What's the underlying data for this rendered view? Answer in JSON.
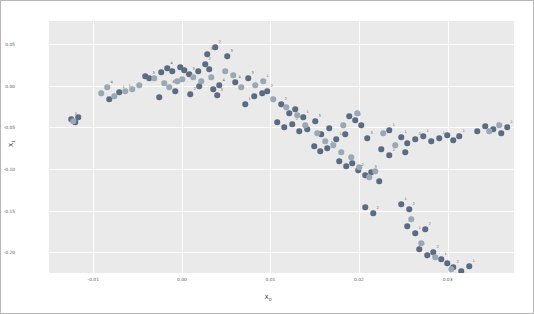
{
  "figure": {
    "background": "#ffffff",
    "border_color": "#b8b8b8",
    "plot_background": "#eaeaea",
    "grid_color": "#ffffff"
  },
  "axis": {
    "xlabel_main": "X",
    "xlabel_sub": "0",
    "ylabel_main": "X",
    "ylabel_sub": "1"
  },
  "chart_data": {
    "type": "scatter",
    "title": "",
    "xlabel": "X_0",
    "ylabel": "X_1",
    "xlim": [
      -0.015,
      0.0375
    ],
    "ylim": [
      -0.225,
      0.0775
    ],
    "xticks": [
      -0.01,
      0.0,
      0.01,
      0.02,
      0.03,
      0.04,
      0.05,
      0.06,
      0.07
    ],
    "xtick_labels": [
      "-0.01",
      "0.00",
      "0.01",
      "0.02",
      "0.03",
      "0.04",
      "0.05",
      "0.06",
      "0.07"
    ],
    "yticks": [
      0.05,
      0.0,
      -0.05,
      -0.1,
      -0.15,
      -0.2
    ],
    "ytick_labels": [
      "0.05",
      "0.00",
      "-0.05",
      "-0.10",
      "-0.15",
      "-0.20"
    ],
    "grid": true,
    "legend": "none",
    "colors": {
      "series_a": "#5b6b82",
      "series_b": "#9aa7b5"
    },
    "series": [
      {
        "name": "series_a",
        "color": "#5b6b82",
        "points": [
          {
            "px": 22,
            "py": 98,
            "label": "2"
          },
          {
            "px": 26,
            "py": 101,
            "label": "3"
          },
          {
            "px": 29,
            "py": 96,
            "label": ""
          },
          {
            "px": 60,
            "py": 78,
            "label": ""
          },
          {
            "px": 70,
            "py": 71,
            "label": "1"
          },
          {
            "px": 96,
            "py": 55,
            "label": ""
          },
          {
            "px": 100,
            "py": 57,
            "label": "3"
          },
          {
            "px": 112,
            "py": 51,
            "label": ""
          },
          {
            "px": 118,
            "py": 47,
            "label": "4"
          },
          {
            "px": 123,
            "py": 50,
            "label": ""
          },
          {
            "px": 131,
            "py": 46,
            "label": ""
          },
          {
            "px": 135,
            "py": 49,
            "label": ""
          },
          {
            "px": 140,
            "py": 53,
            "label": "3"
          },
          {
            "px": 110,
            "py": 76,
            "label": ""
          },
          {
            "px": 126,
            "py": 70,
            "label": ""
          },
          {
            "px": 149,
            "py": 50,
            "label": ""
          },
          {
            "px": 156,
            "py": 43,
            "label": "2"
          },
          {
            "px": 160,
            "py": 48,
            "label": ""
          },
          {
            "px": 166,
            "py": 26,
            "label": "2"
          },
          {
            "px": 158,
            "py": 33,
            "label": "3"
          },
          {
            "px": 178,
            "py": 35,
            "label": "3"
          },
          {
            "px": 141,
            "py": 73,
            "label": "2"
          },
          {
            "px": 150,
            "py": 65,
            "label": ""
          },
          {
            "px": 164,
            "py": 68,
            "label": ""
          },
          {
            "px": 170,
            "py": 64,
            "label": "4"
          },
          {
            "px": 168,
            "py": 74,
            "label": "3"
          },
          {
            "px": 186,
            "py": 61,
            "label": "4"
          },
          {
            "px": 199,
            "py": 57,
            "label": "3"
          },
          {
            "px": 205,
            "py": 75,
            "label": ""
          },
          {
            "px": 213,
            "py": 72,
            "label": ""
          },
          {
            "px": 218,
            "py": 70,
            "label": "2"
          },
          {
            "px": 196,
            "py": 83,
            "label": "1"
          },
          {
            "px": 232,
            "py": 83,
            "label": "2"
          },
          {
            "px": 240,
            "py": 92,
            "label": ""
          },
          {
            "px": 246,
            "py": 88,
            "label": ""
          },
          {
            "px": 254,
            "py": 96,
            "label": "1"
          },
          {
            "px": 228,
            "py": 101,
            "label": ""
          },
          {
            "px": 235,
            "py": 106,
            "label": ""
          },
          {
            "px": 243,
            "py": 103,
            "label": "2"
          },
          {
            "px": 250,
            "py": 110,
            "label": ""
          },
          {
            "px": 258,
            "py": 108,
            "label": ""
          },
          {
            "px": 266,
            "py": 100,
            "label": "3"
          },
          {
            "px": 272,
            "py": 113,
            "label": ""
          },
          {
            "px": 280,
            "py": 107,
            "label": ""
          },
          {
            "px": 287,
            "py": 118,
            "label": "1"
          },
          {
            "px": 265,
            "py": 125,
            "label": ""
          },
          {
            "px": 271,
            "py": 130,
            "label": ""
          },
          {
            "px": 278,
            "py": 127,
            "label": "2"
          },
          {
            "px": 300,
            "py": 95,
            "label": ""
          },
          {
            "px": 306,
            "py": 99,
            "label": "2"
          },
          {
            "px": 312,
            "py": 104,
            "label": ""
          },
          {
            "px": 296,
            "py": 113,
            "label": ""
          },
          {
            "px": 318,
            "py": 117,
            "label": "3"
          },
          {
            "px": 290,
            "py": 140,
            "label": ""
          },
          {
            "px": 297,
            "py": 145,
            "label": "1"
          },
          {
            "px": 303,
            "py": 142,
            "label": ""
          },
          {
            "px": 309,
            "py": 149,
            "label": "2"
          },
          {
            "px": 316,
            "py": 154,
            "label": ""
          },
          {
            "px": 322,
            "py": 151,
            "label": "3"
          },
          {
            "px": 330,
            "py": 160,
            "label": ""
          },
          {
            "px": 340,
            "py": 109,
            "label": "1"
          },
          {
            "px": 352,
            "py": 116,
            "label": "1"
          },
          {
            "px": 358,
            "py": 122,
            "label": ""
          },
          {
            "px": 366,
            "py": 118,
            "label": "2"
          },
          {
            "px": 374,
            "py": 115,
            "label": "1"
          },
          {
            "px": 382,
            "py": 120,
            "label": ""
          },
          {
            "px": 390,
            "py": 117,
            "label": "1"
          },
          {
            "px": 398,
            "py": 114,
            "label": ""
          },
          {
            "px": 404,
            "py": 119,
            "label": "1"
          },
          {
            "px": 410,
            "py": 115,
            "label": "1"
          },
          {
            "px": 332,
            "py": 128,
            "label": ""
          },
          {
            "px": 340,
            "py": 134,
            "label": "1"
          },
          {
            "px": 356,
            "py": 131,
            "label": ""
          },
          {
            "px": 316,
            "py": 186,
            "label": ""
          },
          {
            "px": 324,
            "py": 192,
            "label": "2"
          },
          {
            "px": 352,
            "py": 183,
            "label": "1"
          },
          {
            "px": 360,
            "py": 188,
            "label": "2"
          },
          {
            "px": 358,
            "py": 205,
            "label": ""
          },
          {
            "px": 366,
            "py": 212,
            "label": "1"
          },
          {
            "px": 376,
            "py": 208,
            "label": "2"
          },
          {
            "px": 370,
            "py": 228,
            "label": "1"
          },
          {
            "px": 378,
            "py": 234,
            "label": ""
          },
          {
            "px": 384,
            "py": 231,
            "label": "2"
          },
          {
            "px": 392,
            "py": 238,
            "label": "1"
          },
          {
            "px": 398,
            "py": 242,
            "label": ""
          },
          {
            "px": 404,
            "py": 246,
            "label": "2"
          },
          {
            "px": 412,
            "py": 250,
            "label": ""
          },
          {
            "px": 420,
            "py": 245,
            "label": "1"
          },
          {
            "px": 428,
            "py": 110,
            "label": ""
          },
          {
            "px": 436,
            "py": 105,
            "label": ""
          },
          {
            "px": 444,
            "py": 108,
            "label": "1"
          },
          {
            "px": 452,
            "py": 112,
            "label": ""
          },
          {
            "px": 458,
            "py": 106,
            "label": "1"
          }
        ]
      },
      {
        "name": "series_b",
        "color": "#9aa7b5",
        "points": [
          {
            "px": 24,
            "py": 100,
            "label": ""
          },
          {
            "px": 52,
            "py": 72,
            "label": ""
          },
          {
            "px": 58,
            "py": 66,
            "label": "4"
          },
          {
            "px": 65,
            "py": 75,
            "label": ""
          },
          {
            "px": 76,
            "py": 70,
            "label": "1"
          },
          {
            "px": 83,
            "py": 68,
            "label": ""
          },
          {
            "px": 90,
            "py": 64,
            "label": ""
          },
          {
            "px": 105,
            "py": 57,
            "label": ""
          },
          {
            "px": 115,
            "py": 62,
            "label": ""
          },
          {
            "px": 120,
            "py": 66,
            "label": "6"
          },
          {
            "px": 128,
            "py": 60,
            "label": ""
          },
          {
            "px": 133,
            "py": 58,
            "label": "4"
          },
          {
            "px": 144,
            "py": 56,
            "label": ""
          },
          {
            "px": 152,
            "py": 60,
            "label": ""
          },
          {
            "px": 162,
            "py": 56,
            "label": ""
          },
          {
            "px": 176,
            "py": 50,
            "label": ""
          },
          {
            "px": 184,
            "py": 54,
            "label": ""
          },
          {
            "px": 192,
            "py": 66,
            "label": ""
          },
          {
            "px": 206,
            "py": 64,
            "label": ""
          },
          {
            "px": 214,
            "py": 60,
            "label": "1"
          },
          {
            "px": 224,
            "py": 78,
            "label": ""
          },
          {
            "px": 237,
            "py": 86,
            "label": ""
          },
          {
            "px": 248,
            "py": 94,
            "label": ""
          },
          {
            "px": 256,
            "py": 104,
            "label": ""
          },
          {
            "px": 268,
            "py": 112,
            "label": ""
          },
          {
            "px": 276,
            "py": 120,
            "label": ""
          },
          {
            "px": 284,
            "py": 124,
            "label": ""
          },
          {
            "px": 292,
            "py": 131,
            "label": ""
          },
          {
            "px": 302,
            "py": 136,
            "label": ""
          },
          {
            "px": 310,
            "py": 146,
            "label": ""
          },
          {
            "px": 320,
            "py": 156,
            "label": ""
          },
          {
            "px": 326,
            "py": 150,
            "label": ""
          },
          {
            "px": 294,
            "py": 104,
            "label": ""
          },
          {
            "px": 308,
            "py": 92,
            "label": ""
          },
          {
            "px": 334,
            "py": 112,
            "label": ""
          },
          {
            "px": 346,
            "py": 124,
            "label": ""
          },
          {
            "px": 362,
            "py": 198,
            "label": ""
          },
          {
            "px": 372,
            "py": 222,
            "label": ""
          },
          {
            "px": 386,
            "py": 236,
            "label": ""
          },
          {
            "px": 402,
            "py": 248,
            "label": ""
          },
          {
            "px": 440,
            "py": 110,
            "label": ""
          },
          {
            "px": 450,
            "py": 104,
            "label": ""
          }
        ]
      }
    ]
  }
}
